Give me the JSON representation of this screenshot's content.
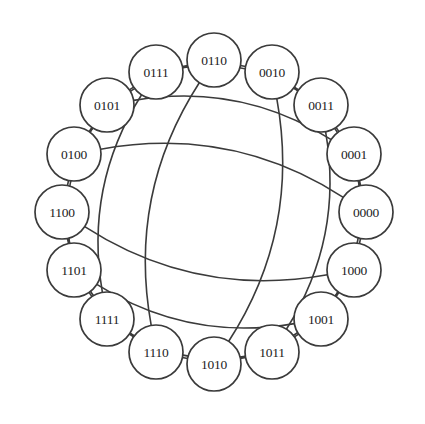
{
  "figure": {
    "background_color": "#ffffff",
    "stroke_color": "#3b3b3b",
    "label_color": "#1d1d1d",
    "node_fill": "#ffffff",
    "node_radius": 27,
    "ring_radius": 152,
    "center_x": 214,
    "center_y": 212
  },
  "chart_data": {
    "type": "diagram",
    "graph_type": "hypercube",
    "dimension": 4,
    "node_count": 16,
    "edge_count": 32,
    "degree": 4,
    "layout": "circular",
    "ring_order_note": "Gray code order: adjacent ring nodes differ in one bit",
    "nodes": [
      {
        "id": "0110",
        "label": "0110",
        "angle_deg": -90,
        "x": 214,
        "y": 60
      },
      {
        "id": "0010",
        "label": "0010",
        "angle_deg": -67.5,
        "x": 272,
        "y": 72
      },
      {
        "id": "0011",
        "label": "0011",
        "angle_deg": -45,
        "x": 321,
        "y": 105
      },
      {
        "id": "0001",
        "label": "0001",
        "angle_deg": -22.5,
        "x": 354,
        "y": 154
      },
      {
        "id": "0000",
        "label": "0000",
        "angle_deg": 0,
        "x": 366,
        "y": 212
      },
      {
        "id": "1000",
        "label": "1000",
        "angle_deg": 22.5,
        "x": 354,
        "y": 270
      },
      {
        "id": "1001",
        "label": "1001",
        "angle_deg": 45,
        "x": 321,
        "y": 319
      },
      {
        "id": "1011",
        "label": "1011",
        "angle_deg": 67.5,
        "x": 272,
        "y": 352
      },
      {
        "id": "1010",
        "label": "1010",
        "angle_deg": 90,
        "x": 214,
        "y": 364
      },
      {
        "id": "1110",
        "label": "1110",
        "angle_deg": 112.5,
        "x": 156,
        "y": 352
      },
      {
        "id": "1111",
        "label": "1111",
        "angle_deg": 135,
        "x": 107,
        "y": 319
      },
      {
        "id": "1101",
        "label": "1101",
        "angle_deg": 157.5,
        "x": 74,
        "y": 270
      },
      {
        "id": "1100",
        "label": "1100",
        "angle_deg": 180,
        "x": 62,
        "y": 212
      },
      {
        "id": "0100",
        "label": "0100",
        "angle_deg": 202.5,
        "x": 74,
        "y": 154
      },
      {
        "id": "0101",
        "label": "0101",
        "angle_deg": 225,
        "x": 107,
        "y": 105
      },
      {
        "id": "0111",
        "label": "0111",
        "angle_deg": 247.5,
        "x": 156,
        "y": 72
      }
    ],
    "edges": [
      {
        "source": "0000",
        "target": "0001"
      },
      {
        "source": "0000",
        "target": "0010"
      },
      {
        "source": "0000",
        "target": "0100"
      },
      {
        "source": "0000",
        "target": "1000"
      },
      {
        "source": "0001",
        "target": "0011"
      },
      {
        "source": "0001",
        "target": "0101"
      },
      {
        "source": "0001",
        "target": "1001"
      },
      {
        "source": "0010",
        "target": "0011"
      },
      {
        "source": "0010",
        "target": "0110"
      },
      {
        "source": "0010",
        "target": "1010"
      },
      {
        "source": "0011",
        "target": "0111"
      },
      {
        "source": "0011",
        "target": "1011"
      },
      {
        "source": "0100",
        "target": "0101"
      },
      {
        "source": "0100",
        "target": "0110"
      },
      {
        "source": "0100",
        "target": "1100"
      },
      {
        "source": "0101",
        "target": "0111"
      },
      {
        "source": "0101",
        "target": "1101"
      },
      {
        "source": "0110",
        "target": "0111"
      },
      {
        "source": "0110",
        "target": "1110"
      },
      {
        "source": "0111",
        "target": "1111"
      },
      {
        "source": "1000",
        "target": "1001"
      },
      {
        "source": "1000",
        "target": "1010"
      },
      {
        "source": "1000",
        "target": "1100"
      },
      {
        "source": "1001",
        "target": "1011"
      },
      {
        "source": "1001",
        "target": "1101"
      },
      {
        "source": "1010",
        "target": "1011"
      },
      {
        "source": "1010",
        "target": "1110"
      },
      {
        "source": "1011",
        "target": "1111"
      },
      {
        "source": "1100",
        "target": "1101"
      },
      {
        "source": "1100",
        "target": "1110"
      },
      {
        "source": "1101",
        "target": "1111"
      },
      {
        "source": "1110",
        "target": "1111"
      }
    ]
  }
}
